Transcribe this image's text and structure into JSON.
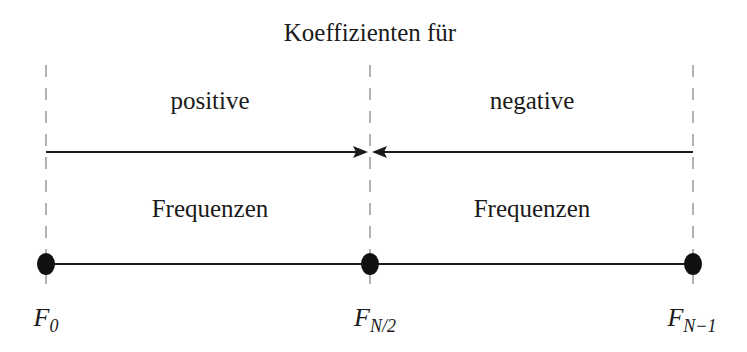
{
  "title": "Koeffizienten für",
  "regions": [
    {
      "top_label": "positive",
      "bottom_label": "Frequenzen"
    },
    {
      "top_label": "negative",
      "bottom_label": "Frequenzen"
    }
  ],
  "points": [
    {
      "base": "F",
      "sub": "0"
    },
    {
      "base": "F",
      "sub": "N/2"
    },
    {
      "base": "F",
      "sub": "N−1"
    }
  ],
  "colors": {
    "line": "#1a1a1a",
    "dash": "#555555",
    "background": "#ffffff"
  }
}
